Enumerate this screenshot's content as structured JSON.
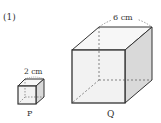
{
  "problem": {
    "number": "(1)"
  },
  "cubes": [
    {
      "id": "P",
      "label": "P",
      "edge_label": "2 cm",
      "edge_length_cm": 2
    },
    {
      "id": "Q",
      "label": "Q",
      "edge_label": "6 cm",
      "edge_length_cm": 6
    }
  ],
  "colors": {
    "stroke": "#333333",
    "front_face": "#f2f2f2",
    "top_face": "#f7f7f7",
    "side_face": "#d9d9d9",
    "hidden_edge": "#555555"
  }
}
